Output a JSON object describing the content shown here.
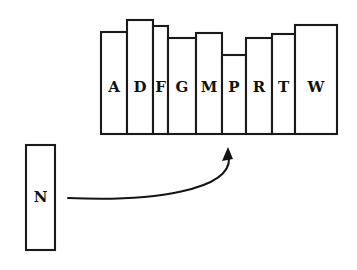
{
  "figure": {
    "background_color": "#ffffff",
    "ink_color": "#1a1a1a"
  },
  "chart_data": {
    "type": "bar",
    "title": "",
    "xlabel": "",
    "ylabel": "",
    "grid": false,
    "legend": null,
    "baseline_y": 134,
    "categories": [
      "A",
      "D",
      "F",
      "G",
      "M",
      "P",
      "R",
      "T",
      "W"
    ],
    "values": [
      102,
      114,
      108,
      96,
      101,
      79,
      96,
      100,
      109
    ],
    "ylim": [
      0,
      120
    ],
    "bars": [
      {
        "label": "A",
        "x": 101,
        "width": 26,
        "top": 32,
        "bottom": 134
      },
      {
        "label": "D",
        "x": 127,
        "width": 26,
        "top": 20,
        "bottom": 134
      },
      {
        "label": "F",
        "x": 153,
        "width": 15,
        "top": 26,
        "bottom": 134
      },
      {
        "label": "G",
        "x": 168,
        "width": 28,
        "top": 38,
        "bottom": 134
      },
      {
        "label": "M",
        "x": 196,
        "width": 26,
        "top": 33,
        "bottom": 134
      },
      {
        "label": "P",
        "x": 222,
        "width": 24,
        "top": 55,
        "bottom": 134
      },
      {
        "label": "R",
        "x": 246,
        "width": 26,
        "top": 38,
        "bottom": 134
      },
      {
        "label": "T",
        "x": 272,
        "width": 23,
        "top": 34,
        "bottom": 134
      },
      {
        "label": "W",
        "x": 295,
        "width": 42,
        "top": 25,
        "bottom": 134
      }
    ]
  },
  "source_item": {
    "label": "N",
    "x": 26,
    "y": 145,
    "width": 29,
    "height": 105
  },
  "arrow": {
    "name": "insertion-arrow",
    "start_x": 68,
    "start_y": 198,
    "tip_x": 228,
    "tip_y": 147,
    "points_to": "P",
    "description": "curved arrow from N to insertion slot before P"
  }
}
